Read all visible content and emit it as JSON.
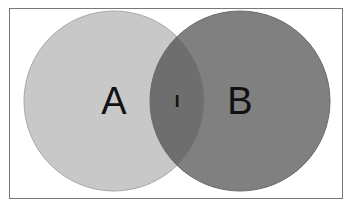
{
  "figure": {
    "kind": "venn-diagram",
    "title": "",
    "background_color": "#ffffff",
    "frame": {
      "visible": true,
      "border_color": "#787878",
      "border_width_px": 1,
      "x": 9,
      "y": 8,
      "width": 334,
      "height": 191
    }
  },
  "chart_data": {
    "type": "venn",
    "title": "",
    "xlabel": "",
    "ylabel": "",
    "grid": false,
    "legend": "none",
    "sets": [
      {
        "id": "A",
        "label": "A",
        "fill_color": "#c8c8c8",
        "stroke_color": "#a8a8a8",
        "center_x": 114,
        "center_y": 101,
        "radius": 90,
        "label_x": 114,
        "label_y": 114
      },
      {
        "id": "B",
        "label": "B",
        "fill_color": "#808080",
        "stroke_color": "#6a6a6a",
        "center_x": 240,
        "center_y": 101,
        "radius": 90,
        "label_x": 240,
        "label_y": 114
      }
    ],
    "intersection": {
      "id": "A_and_B",
      "label": "I",
      "fill_color": "#6e6e6e",
      "label_x": 177,
      "label_y": 107
    }
  },
  "labels": {
    "set_a": "A",
    "set_b": "B",
    "intersection": "I"
  }
}
